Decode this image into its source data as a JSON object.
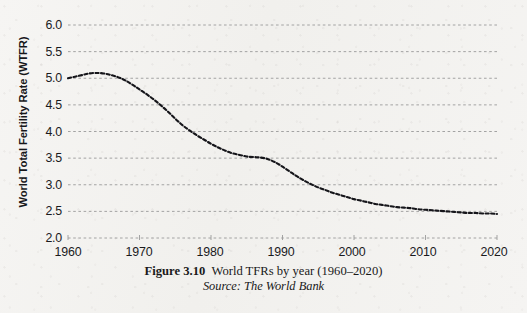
{
  "figure": {
    "caption_label": "Figure 3.10",
    "caption_title": "World TFRs by year (1960–2020)",
    "caption_source": "Source: The World Bank"
  },
  "axes": {
    "y_label": "World Total Fertility Rate (WTFR)",
    "y_ticks": [
      "6.0",
      "5.5",
      "5.0",
      "4.5",
      "4.0",
      "3.5",
      "3.0",
      "2.5",
      "2.0"
    ],
    "x_ticks": [
      "1960",
      "1970",
      "1980",
      "1990",
      "2000",
      "2010",
      "2020"
    ]
  },
  "style": {
    "line_color": "#15151a",
    "grid_color": "#9a9a9a",
    "text_color": "#1a1a1d",
    "paper_color": "#f4f3f1"
  },
  "chart_data": {
    "type": "line",
    "title": "World TFRs by year (1960–2020)",
    "subtitle": "Source: The World Bank",
    "xlabel": "",
    "ylabel": "World Total Fertility Rate (WTFR)",
    "xlim": [
      1960,
      2020
    ],
    "ylim": [
      2.0,
      6.0
    ],
    "ytick_step": 0.5,
    "xtick_step": 10,
    "grid": "horizontal-dashed",
    "legend": "none",
    "line_style": "dashed",
    "x": [
      1960,
      1961,
      1962,
      1963,
      1964,
      1965,
      1966,
      1967,
      1968,
      1969,
      1970,
      1971,
      1972,
      1973,
      1974,
      1975,
      1976,
      1977,
      1978,
      1979,
      1980,
      1981,
      1982,
      1983,
      1984,
      1985,
      1986,
      1987,
      1988,
      1989,
      1990,
      1991,
      1992,
      1993,
      1994,
      1995,
      1996,
      1997,
      1998,
      1999,
      2000,
      2001,
      2002,
      2003,
      2004,
      2005,
      2006,
      2007,
      2008,
      2009,
      2010,
      2011,
      2012,
      2013,
      2014,
      2015,
      2016,
      2017,
      2018,
      2019,
      2020
    ],
    "series": [
      {
        "name": "World Total Fertility Rate",
        "values": [
          5.0,
          5.03,
          5.06,
          5.09,
          5.1,
          5.09,
          5.06,
          5.02,
          4.96,
          4.88,
          4.79,
          4.7,
          4.6,
          4.49,
          4.37,
          4.24,
          4.12,
          4.02,
          3.93,
          3.85,
          3.77,
          3.7,
          3.64,
          3.59,
          3.56,
          3.53,
          3.52,
          3.51,
          3.48,
          3.42,
          3.34,
          3.25,
          3.16,
          3.08,
          3.01,
          2.95,
          2.9,
          2.85,
          2.81,
          2.77,
          2.73,
          2.7,
          2.67,
          2.64,
          2.62,
          2.6,
          2.58,
          2.57,
          2.56,
          2.54,
          2.53,
          2.52,
          2.51,
          2.5,
          2.49,
          2.48,
          2.47,
          2.47,
          2.46,
          2.46,
          2.45
        ]
      }
    ]
  }
}
